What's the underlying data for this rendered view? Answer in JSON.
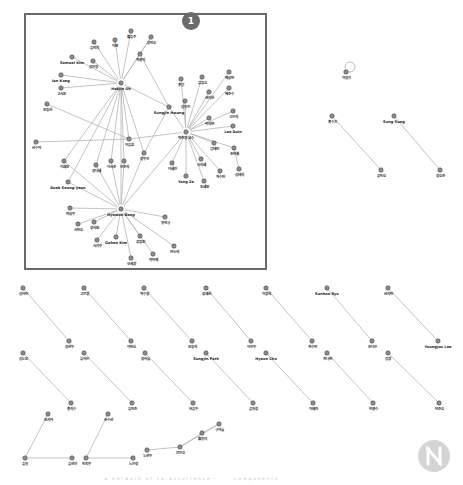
{
  "figure": {
    "highlight_badge": "1",
    "caption": "· · ·  a network of co-occurrence  · · ·  components  · · ·",
    "colors": {
      "edge": "#b5b5b5",
      "node_fill": "#8c8c8c",
      "node_stroke": "#4a4a4a",
      "label": "#222222",
      "frame": "#6a6a6a",
      "badge": "#6b6b6b"
    }
  },
  "graph": {
    "nodes": [
      {
        "id": "h1",
        "label": "Hakjin Oh",
        "x": 121,
        "y": 83,
        "hub": true
      },
      {
        "id": "h2",
        "label": "박준영 교수",
        "x": 186,
        "y": 132,
        "hub": true
      },
      {
        "id": "h3",
        "label": "Hyewon Bang",
        "x": 121,
        "y": 209,
        "hub": true
      },
      {
        "id": "a1",
        "label": "송민지",
        "x": 94,
        "y": 42
      },
      {
        "id": "a2",
        "label": "이환",
        "x": 115,
        "y": 40
      },
      {
        "id": "a3",
        "label": "황승주",
        "x": 131,
        "y": 31
      },
      {
        "id": "a4",
        "label": "강민호",
        "x": 151,
        "y": 37
      },
      {
        "id": "a5",
        "label": "Samuel Kim",
        "x": 72,
        "y": 57
      },
      {
        "id": "a6",
        "label": "김은정",
        "x": 93,
        "y": 61
      },
      {
        "id": "a7",
        "label": "최경석",
        "x": 140,
        "y": 54
      },
      {
        "id": "a8",
        "label": "Ian Kang",
        "x": 61,
        "y": 75
      },
      {
        "id": "a9",
        "label": "고서윤",
        "x": 61,
        "y": 88
      },
      {
        "id": "a10",
        "label": "윤동현",
        "x": 47,
        "y": 104
      },
      {
        "id": "b1",
        "label": "Sungjin Hwang",
        "x": 169,
        "y": 107
      },
      {
        "id": "b2",
        "label": "홍길",
        "x": 181,
        "y": 79
      },
      {
        "id": "b3",
        "label": "송동호",
        "x": 202,
        "y": 77
      },
      {
        "id": "b4",
        "label": "배성민",
        "x": 229,
        "y": 72
      },
      {
        "id": "b5",
        "label": "권지현",
        "x": 209,
        "y": 92
      },
      {
        "id": "b6",
        "label": "배준수",
        "x": 229,
        "y": 88
      },
      {
        "id": "b7",
        "label": "김유진",
        "x": 185,
        "y": 101
      },
      {
        "id": "b8",
        "label": "고은희",
        "x": 233,
        "y": 111
      },
      {
        "id": "b9",
        "label": "박지연",
        "x": 209,
        "y": 118
      },
      {
        "id": "b10",
        "label": "Lee Dain",
        "x": 233,
        "y": 126
      },
      {
        "id": "b11",
        "label": "이승훈",
        "x": 129,
        "y": 139
      },
      {
        "id": "b12",
        "label": "정우진",
        "x": 144,
        "y": 153
      },
      {
        "id": "b13",
        "label": "임태민",
        "x": 214,
        "y": 143
      },
      {
        "id": "b14",
        "label": "조민철",
        "x": 234,
        "y": 148
      },
      {
        "id": "b15",
        "label": "이혜진",
        "x": 172,
        "y": 163
      },
      {
        "id": "b16",
        "label": "서지혜",
        "x": 201,
        "y": 159
      },
      {
        "id": "b17",
        "label": "Yang Ze",
        "x": 186,
        "y": 176
      },
      {
        "id": "b18",
        "label": "윤혜원",
        "x": 204,
        "y": 181
      },
      {
        "id": "b19",
        "label": "최수민",
        "x": 220,
        "y": 171
      },
      {
        "id": "b20",
        "label": "김태희",
        "x": 239,
        "y": 169
      },
      {
        "id": "c1",
        "label": "한수아",
        "x": 36,
        "y": 142
      },
      {
        "id": "c2",
        "label": "이채윤",
        "x": 64,
        "y": 161
      },
      {
        "id": "c3",
        "label": "정다혜",
        "x": 96,
        "y": 165
      },
      {
        "id": "c4",
        "label": "이서준",
        "x": 111,
        "y": 161
      },
      {
        "id": "c5",
        "label": "문준희",
        "x": 124,
        "y": 161
      },
      {
        "id": "c6",
        "label": "Baek Seung-yeon",
        "x": 68,
        "y": 182
      },
      {
        "id": "c7",
        "label": "박성우",
        "x": 70,
        "y": 208
      },
      {
        "id": "c8",
        "label": "서민호",
        "x": 78,
        "y": 224
      },
      {
        "id": "c9",
        "label": "장지원",
        "x": 94,
        "y": 222
      },
      {
        "id": "c10",
        "label": "유민규",
        "x": 165,
        "y": 217
      },
      {
        "id": "c11",
        "label": "서지우",
        "x": 97,
        "y": 240
      },
      {
        "id": "c12",
        "label": "Gahee Kim",
        "x": 116,
        "y": 237
      },
      {
        "id": "c13",
        "label": "강동원",
        "x": 140,
        "y": 236
      },
      {
        "id": "c14",
        "label": "오세영",
        "x": 131,
        "y": 258
      },
      {
        "id": "c15",
        "label": "박민재",
        "x": 153,
        "y": 254
      },
      {
        "id": "c16",
        "label": "안소희",
        "x": 174,
        "y": 246
      },
      {
        "id": "s1",
        "label": "이정후",
        "x": 346,
        "y": 72,
        "self_loop": true
      },
      {
        "id": "p1a",
        "label": "홍수진",
        "x": 332,
        "y": 116
      },
      {
        "id": "p1b",
        "label": "강인호",
        "x": 381,
        "y": 170
      },
      {
        "id": "p2a",
        "label": "Sung Sung",
        "x": 394,
        "y": 116
      },
      {
        "id": "p2b",
        "label": "정호준",
        "x": 440,
        "y": 170
      },
      {
        "id": "q1a",
        "label": "김하린",
        "x": 23,
        "y": 288
      },
      {
        "id": "q1b",
        "label": "정현우",
        "x": 69,
        "y": 341
      },
      {
        "id": "q2a",
        "label": "고은영",
        "x": 84,
        "y": 288
      },
      {
        "id": "q2b",
        "label": "이민호",
        "x": 131,
        "y": 341
      },
      {
        "id": "q3a",
        "label": "최수영",
        "x": 144,
        "y": 288
      },
      {
        "id": "q3b",
        "label": "윤동희",
        "x": 192,
        "y": 341
      },
      {
        "id": "q4a",
        "label": "장세현",
        "x": 206,
        "y": 288
      },
      {
        "id": "q4b",
        "label": "이진우",
        "x": 251,
        "y": 341
      },
      {
        "id": "q5a",
        "label": "이영희",
        "x": 266,
        "y": 288
      },
      {
        "id": "q5b",
        "label": "최수빈",
        "x": 312,
        "y": 341
      },
      {
        "id": "q6a",
        "label": "Sunhae Ryu",
        "x": 327,
        "y": 288
      },
      {
        "id": "q6b",
        "label": "윤다은",
        "x": 372,
        "y": 341
      },
      {
        "id": "q7a",
        "label": "한지민",
        "x": 388,
        "y": 288
      },
      {
        "id": "q7b",
        "label": "Youngjoo Lee",
        "x": 438,
        "y": 341
      },
      {
        "id": "r1a",
        "label": "김도윤",
        "x": 23,
        "y": 353
      },
      {
        "id": "r1b",
        "label": "홍지수",
        "x": 71,
        "y": 403
      },
      {
        "id": "r2a",
        "label": "송하은",
        "x": 84,
        "y": 353
      },
      {
        "id": "r2b",
        "label": "송민준",
        "x": 132,
        "y": 403
      },
      {
        "id": "r3a",
        "label": "정하늘",
        "x": 145,
        "y": 353
      },
      {
        "id": "r3b",
        "label": "한승우",
        "x": 193,
        "y": 403
      },
      {
        "id": "r4a",
        "label": "Sungjin Park",
        "x": 206,
        "y": 353
      },
      {
        "id": "r4b",
        "label": "송유정",
        "x": 253,
        "y": 403
      },
      {
        "id": "r5a",
        "label": "Hyeon Cho",
        "x": 266,
        "y": 353
      },
      {
        "id": "r5b",
        "label": "이예린",
        "x": 313,
        "y": 403
      },
      {
        "id": "r6a",
        "label": "최나연",
        "x": 327,
        "y": 353
      },
      {
        "id": "r6b",
        "label": "민경수",
        "x": 373,
        "y": 403
      },
      {
        "id": "r7a",
        "label": "김영",
        "x": 388,
        "y": 353
      },
      {
        "id": "r7b",
        "label": "민준호",
        "x": 439,
        "y": 403
      },
      {
        "id": "t1",
        "label": "윤지아",
        "x": 48,
        "y": 414
      },
      {
        "id": "t2",
        "label": "송유",
        "x": 25,
        "y": 458
      },
      {
        "id": "t3",
        "label": "송현진",
        "x": 72,
        "y": 458
      },
      {
        "id": "t4",
        "label": "조수현",
        "x": 108,
        "y": 414
      },
      {
        "id": "t5",
        "label": "민지우",
        "x": 86,
        "y": 458
      },
      {
        "id": "t6",
        "label": "노은정",
        "x": 133,
        "y": 458
      },
      {
        "id": "t7",
        "label": "노현우",
        "x": 147,
        "y": 450
      },
      {
        "id": "t8",
        "label": "전은호",
        "x": 180,
        "y": 447
      },
      {
        "id": "t9",
        "label": "황유리",
        "x": 202,
        "y": 433
      },
      {
        "id": "t10",
        "label": "구하늘",
        "x": 219,
        "y": 424
      }
    ],
    "edges": [
      [
        "h1",
        "a1"
      ],
      [
        "h1",
        "a2"
      ],
      [
        "h1",
        "a3"
      ],
      [
        "h1",
        "a4"
      ],
      [
        "h1",
        "a5"
      ],
      [
        "h1",
        "a6"
      ],
      [
        "h1",
        "a7"
      ],
      [
        "h1",
        "a8"
      ],
      [
        "h1",
        "a9"
      ],
      [
        "h1",
        "b1"
      ],
      [
        "h1",
        "b11"
      ],
      [
        "h1",
        "c2"
      ],
      [
        "h1",
        "c3"
      ],
      [
        "h1",
        "c4"
      ],
      [
        "h1",
        "c5"
      ],
      [
        "h1",
        "c6"
      ],
      [
        "h1",
        "h3"
      ],
      [
        "h1",
        "b12"
      ],
      [
        "a7",
        "b1"
      ],
      [
        "a4",
        "a7"
      ],
      [
        "a10",
        "b11"
      ],
      [
        "h2",
        "b1"
      ],
      [
        "h2",
        "b2"
      ],
      [
        "h2",
        "b3"
      ],
      [
        "h2",
        "b4"
      ],
      [
        "h2",
        "b5"
      ],
      [
        "h2",
        "b6"
      ],
      [
        "h2",
        "b7"
      ],
      [
        "h2",
        "b8"
      ],
      [
        "h2",
        "b9"
      ],
      [
        "h2",
        "b10"
      ],
      [
        "h2",
        "b11"
      ],
      [
        "h2",
        "b13"
      ],
      [
        "h2",
        "b14"
      ],
      [
        "h2",
        "b15"
      ],
      [
        "h2",
        "b16"
      ],
      [
        "h2",
        "b17"
      ],
      [
        "h2",
        "b18"
      ],
      [
        "h2",
        "b19"
      ],
      [
        "h2",
        "h3"
      ],
      [
        "b14",
        "b20"
      ],
      [
        "b1",
        "b12"
      ],
      [
        "c1",
        "b11"
      ],
      [
        "h3",
        "c6"
      ],
      [
        "h3",
        "c7"
      ],
      [
        "h3",
        "c8"
      ],
      [
        "h3",
        "c9"
      ],
      [
        "h3",
        "c10"
      ],
      [
        "h3",
        "c11"
      ],
      [
        "h3",
        "c12"
      ],
      [
        "h3",
        "c13"
      ],
      [
        "h3",
        "c14"
      ],
      [
        "h3",
        "c15"
      ],
      [
        "h3",
        "c16"
      ],
      [
        "h3",
        "c3"
      ],
      [
        "h3",
        "c4"
      ],
      [
        "h3",
        "c5"
      ],
      [
        "h3",
        "b12"
      ],
      [
        "h3",
        "c2"
      ],
      [
        "p1a",
        "p1b"
      ],
      [
        "p2a",
        "p2b"
      ],
      [
        "q1a",
        "q1b"
      ],
      [
        "q2a",
        "q2b"
      ],
      [
        "q3a",
        "q3b"
      ],
      [
        "q4a",
        "q4b"
      ],
      [
        "q5a",
        "q5b"
      ],
      [
        "q6a",
        "q6b"
      ],
      [
        "q7a",
        "q7b"
      ],
      [
        "r1a",
        "r1b"
      ],
      [
        "r2a",
        "r2b"
      ],
      [
        "r3a",
        "r3b"
      ],
      [
        "r4a",
        "r4b"
      ],
      [
        "r5a",
        "r5b"
      ],
      [
        "r6a",
        "r6b"
      ],
      [
        "r7a",
        "r7b"
      ],
      [
        "t1",
        "t2"
      ],
      [
        "t2",
        "t3"
      ],
      [
        "t4",
        "t5"
      ],
      [
        "t5",
        "t6"
      ],
      [
        "t7",
        "t8"
      ],
      [
        "t8",
        "t9"
      ],
      [
        "t9",
        "t10"
      ],
      [
        "t8",
        "t10"
      ]
    ]
  }
}
